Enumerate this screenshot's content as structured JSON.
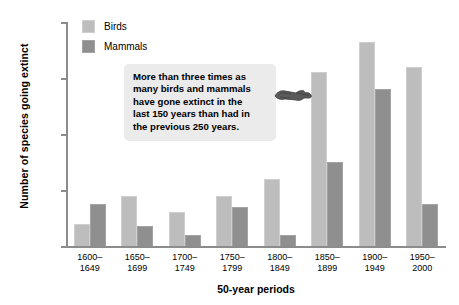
{
  "chart_data": {
    "type": "bar",
    "title": "",
    "xlabel": "50-year periods",
    "ylabel": "Number of species going extinct",
    "ylim": [
      0,
      40
    ],
    "yticks": [
      0,
      10,
      20,
      30,
      40
    ],
    "grid": false,
    "legend_position": "top-left",
    "categories": [
      "1600–\n1649",
      "1650–\n1699",
      "1700–\n1749",
      "1750–\n1799",
      "1800–\n1849",
      "1850–\n1899",
      "1900–\n1949",
      "1950–\n2000"
    ],
    "category_lines": [
      [
        "1600–",
        "1649"
      ],
      [
        "1650–",
        "1699"
      ],
      [
        "1700–",
        "1749"
      ],
      [
        "1750–",
        "1799"
      ],
      [
        "1800–",
        "1849"
      ],
      [
        "1850–",
        "1899"
      ],
      [
        "1900–",
        "1949"
      ],
      [
        "1950–",
        "2000"
      ]
    ],
    "series": [
      {
        "name": "Birds",
        "color": "#bdbdbd",
        "values": [
          4,
          9,
          6,
          9,
          12,
          31,
          36.5,
          32
        ]
      },
      {
        "name": "Mammals",
        "color": "#8f8f8f",
        "values": [
          7.5,
          3.5,
          2,
          7,
          2,
          15,
          28,
          7.5
        ]
      }
    ],
    "annotations": [
      {
        "name": "callout",
        "text": "More than three times as many birds and mammals have gone extinct in the last 150 years than had in the previous 250 years.",
        "lines": [
          "More than three times as",
          "many birds and mammals",
          "have gone extinct in the",
          "last 150 years than had in",
          "the previous 250 years."
        ],
        "points_to": "1850–1899"
      }
    ]
  }
}
